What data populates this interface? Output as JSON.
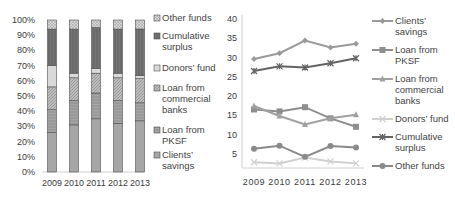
{
  "chart_data": [
    {
      "type": "bar",
      "stacked": true,
      "percent": true,
      "title": "",
      "xlabel": "",
      "ylabel": "",
      "categories": [
        "2009",
        "2010",
        "2011",
        "2012",
        "2013"
      ],
      "ylim": [
        0,
        100
      ],
      "yticks": [
        "0%",
        "10%",
        "20%",
        "30%",
        "40%",
        "50%",
        "60%",
        "70%",
        "80%",
        "90%",
        "100%"
      ],
      "legend_position": "right",
      "series": [
        {
          "name": "Clients' savings",
          "values": [
            26,
            31,
            35,
            32,
            34
          ],
          "color": "#a6a6a6",
          "pattern": "solid"
        },
        {
          "name": "Loan from PKSF",
          "values": [
            15,
            16,
            17,
            15,
            12
          ],
          "color": "#9c9c9c",
          "pattern": "horizontal"
        },
        {
          "name": "Loan from commercial banks",
          "values": [
            15,
            15,
            13,
            15,
            16
          ],
          "color": "#b4b4b4",
          "pattern": "diagonal"
        },
        {
          "name": "Donors' fund",
          "values": [
            14,
            3,
            3,
            3,
            2
          ],
          "color": "#d9d9d9",
          "pattern": "solid"
        },
        {
          "name": "Cumulative surplus",
          "values": [
            24,
            29,
            27,
            29,
            31
          ],
          "color": "#707070",
          "pattern": "vertical"
        },
        {
          "name": "Other funds",
          "values": [
            6,
            6,
            5,
            6,
            6
          ],
          "color": "#c8c8c8",
          "pattern": "dots"
        }
      ],
      "legend_order": [
        "Other funds",
        "Cumulative surplus",
        "Donors' fund",
        "Loan from commercial banks",
        "Loan from PKSF",
        "Clients' savings"
      ]
    },
    {
      "type": "line",
      "title": "",
      "xlabel": "",
      "ylabel": "",
      "x": [
        "2009",
        "2010",
        "2011",
        "2012",
        "2013"
      ],
      "ylim": [
        0,
        40
      ],
      "yticks": [
        "5",
        "10",
        "15",
        "20",
        "25",
        "30",
        "35",
        "40"
      ],
      "grid": false,
      "legend_position": "right",
      "series": [
        {
          "name": "Clients' savings",
          "values": [
            29.6,
            31.1,
            34.4,
            32.6,
            33.6
          ],
          "color": "#9a9a9a",
          "marker": "diamond"
        },
        {
          "name": "Loan from PKSF",
          "values": [
            16.5,
            16.0,
            17.1,
            14.2,
            12.0
          ],
          "color": "#8e8e8e",
          "marker": "square"
        },
        {
          "name": "Loan from commercial banks",
          "values": [
            17.4,
            14.8,
            12.6,
            14.2,
            15.1
          ],
          "color": "#a0a0a0",
          "marker": "triangle"
        },
        {
          "name": "Donors' fund",
          "values": [
            2.8,
            2.5,
            4.0,
            3.0,
            2.5
          ],
          "color": "#d0d0d0",
          "marker": "x"
        },
        {
          "name": "Cumulative surplus",
          "values": [
            26.5,
            27.7,
            27.4,
            28.5,
            29.8
          ],
          "color": "#646464",
          "marker": "star"
        },
        {
          "name": "Other funds",
          "values": [
            6.3,
            7.1,
            4.2,
            7.0,
            6.6
          ],
          "color": "#8a8a8a",
          "marker": "circle"
        }
      ]
    }
  ]
}
